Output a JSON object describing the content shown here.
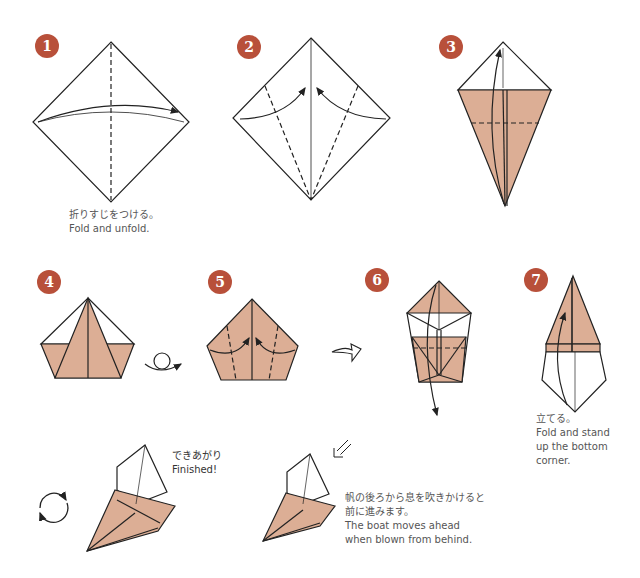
{
  "colors": {
    "badge": "#b8503a",
    "paper": "#dcae95",
    "line": "#222222",
    "text": "#555555"
  },
  "steps": [
    {
      "number": "1",
      "caption_ja": "折りすじをつける。",
      "caption_en": "Fold and unfold."
    },
    {
      "number": "2"
    },
    {
      "number": "3"
    },
    {
      "number": "4"
    },
    {
      "number": "5"
    },
    {
      "number": "6"
    },
    {
      "number": "7",
      "caption_ja": "立てる。",
      "caption_en_lines": [
        "Fold and stand",
        "up the bottom",
        "corner."
      ]
    }
  ],
  "finished": {
    "label_ja": "できあがり",
    "label_en": "Finished!"
  },
  "usage": {
    "text_ja_lines": [
      "帆の後ろから息を吹きかけると",
      "前に進みます。"
    ],
    "text_en_lines": [
      "The boat moves ahead",
      "when blown from behind."
    ]
  },
  "icons": [
    "turn-over-icon",
    "next-step-arrow-icon",
    "rotate-icon",
    "blow-direction-arrow-icon"
  ]
}
